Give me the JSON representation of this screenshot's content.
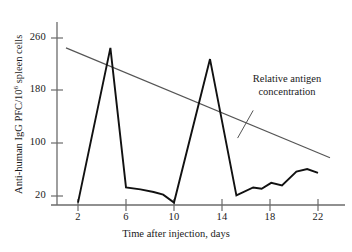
{
  "chart_data": {
    "type": "line",
    "title": "",
    "subtitle": "",
    "xlabel": "Time after injection, days",
    "ylabel": "Anti-human IgG PFC/10⁶ spleen cells",
    "ylabel_parts": {
      "pre": "Anti-human IgG PFC/10",
      "sup": "6",
      "post": " spleen cells"
    },
    "xlim": [
      1,
      23
    ],
    "ylim": [
      5,
      275
    ],
    "grid": false,
    "legend_position": "inline-annotation",
    "xticks": [
      2,
      6,
      10,
      14,
      18,
      22
    ],
    "xtick_labels": [
      "2",
      "6",
      "10",
      "14",
      "18",
      "22"
    ],
    "yticks": [
      20,
      100,
      180,
      260
    ],
    "ytick_labels": [
      "20",
      "100",
      "180",
      "260"
    ],
    "series": [
      {
        "name": "Anti-human IgG PFC response",
        "style": "solid-thick",
        "color": "#111111",
        "points": [
          {
            "x": 2.0,
            "y": 10
          },
          {
            "x": 4.7,
            "y": 245
          },
          {
            "x": 6.0,
            "y": 33
          },
          {
            "x": 7.2,
            "y": 30
          },
          {
            "x": 8.3,
            "y": 26
          },
          {
            "x": 9.1,
            "y": 22
          },
          {
            "x": 10.0,
            "y": 10
          },
          {
            "x": 13.0,
            "y": 228
          },
          {
            "x": 15.2,
            "y": 21
          },
          {
            "x": 16.6,
            "y": 33
          },
          {
            "x": 17.3,
            "y": 31
          },
          {
            "x": 18.1,
            "y": 40
          },
          {
            "x": 19.0,
            "y": 36
          },
          {
            "x": 20.2,
            "y": 57
          },
          {
            "x": 21.1,
            "y": 61
          },
          {
            "x": 22.0,
            "y": 55
          }
        ]
      },
      {
        "name": "Relative antigen concentration",
        "style": "solid-thin",
        "color": "#555555",
        "points": [
          {
            "x": 1.0,
            "y": 245
          },
          {
            "x": 23.0,
            "y": 78
          }
        ]
      }
    ],
    "annotations": [
      {
        "name": "relative-antigen-concentration-label",
        "text": "Relative antigen concentration",
        "line1": "Relative antigen",
        "line2": "concentration",
        "leader_from": {
          "x": 16.6,
          "y": 150
        },
        "leader_to": {
          "x": 15.3,
          "y": 108
        }
      }
    ]
  },
  "axes": {
    "axis_color": "#555555",
    "line_color": "#111111"
  }
}
